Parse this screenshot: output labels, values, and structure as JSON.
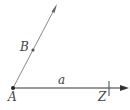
{
  "diagram": {
    "title": "",
    "colors": {
      "line": "#333333",
      "ray_ab": "#777777",
      "point": "#222222",
      "label": "#444444"
    },
    "points": {
      "A": {
        "label": "A",
        "x": 13,
        "y": 88
      },
      "B": {
        "label": "B",
        "x": 33,
        "y": 50
      },
      "Z": {
        "label": "Z",
        "x": 109,
        "y": 88
      }
    },
    "rays": [
      {
        "name": "ray-AB",
        "from": "A",
        "through": "B",
        "end": {
          "x": 56,
          "y": 6
        }
      },
      {
        "name": "ray-a",
        "from": "A",
        "end": {
          "x": 128,
          "y": 88
        },
        "label": "a"
      }
    ],
    "labels": {
      "A": "A",
      "B": "B",
      "Z": "Z",
      "a": "a"
    }
  }
}
